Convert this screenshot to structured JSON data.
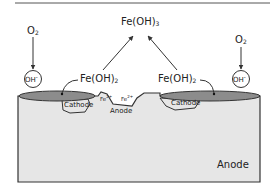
{
  "diagram": {
    "labels": {
      "fe_oh3": "Fe(OH)",
      "fe_oh3_sub": "3",
      "fe_oh2_left": "Fe(OH)",
      "fe_oh2_left_sub": "2",
      "fe_oh2_right": "Fe(OH)",
      "fe_oh2_right_sub": "2",
      "o2_left": "O",
      "o2_left_sub": "2",
      "o2_right": "O",
      "o2_right_sub": "2",
      "oh_left": "OH",
      "oh_left_sup": "-",
      "oh_right": "OH",
      "oh_right_sup": "-",
      "fe2_a": "Fe",
      "fe2_a_sup": "2+",
      "fe2_b": "Fe",
      "fe2_b_sup": "2+",
      "cathode_left": "Cathode",
      "cathode_right": "Cathode",
      "anode_pit": "Anode",
      "anode_bulk": "Anode"
    },
    "colors": {
      "metal_fill": "#e6e6e6",
      "deposit_fill": "#8c8c8c",
      "stroke": "#333333",
      "text": "#222222"
    }
  }
}
